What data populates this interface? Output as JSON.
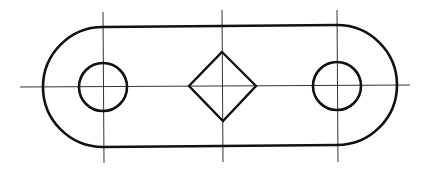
{
  "drawing": {
    "type": "technical-drawing",
    "subject": "slotted link plate with two circular holes and a square (diamond) hole",
    "colors": {
      "stroke": "#111111",
      "background": "#ffffff"
    },
    "outline": {
      "left_center": [
        103,
        86
      ],
      "right_center": [
        337,
        86
      ],
      "radius": 60
    },
    "holes": [
      {
        "shape": "circle",
        "center": [
          103,
          87
        ],
        "radius": 24
      },
      {
        "shape": "diamond",
        "center": [
          222,
          86
        ],
        "half_diagonal": 34
      },
      {
        "shape": "circle",
        "center": [
          337,
          86
        ],
        "radius": 24
      }
    ],
    "centerlines": {
      "horizontal": {
        "y": 86,
        "x_from": 20,
        "x_to": 410
      },
      "vertical": [
        {
          "x": 103,
          "y_from": 12,
          "y_to": 163
        },
        {
          "x": 222,
          "y_from": 10,
          "y_to": 162
        },
        {
          "x": 337,
          "y_from": 10,
          "y_to": 162
        }
      ]
    }
  }
}
